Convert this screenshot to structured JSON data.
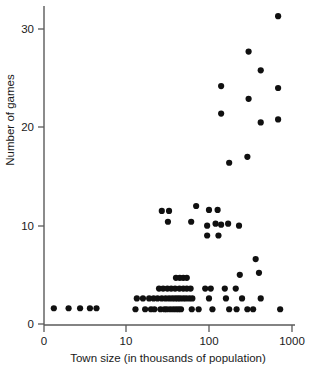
{
  "chart_data": {
    "type": "scatter",
    "title": "",
    "xlabel": "Town size  (in thousands of population)",
    "ylabel": "Number of games",
    "x_scale": "log",
    "y_scale": "linear",
    "xtick_labels": [
      "0",
      "10",
      "100",
      "1000"
    ],
    "xtick_values": [
      0,
      10,
      100,
      1000
    ],
    "ytick_labels": [
      "0",
      "10",
      "20",
      "30"
    ],
    "ytick_values": [
      0,
      10,
      20,
      30
    ],
    "ylim": [
      0,
      32.5
    ],
    "grid": false,
    "legend": null,
    "marker": "filled-circle",
    "marker_color": "#101010",
    "marker_size_px": 6.2,
    "n_points": 92,
    "points": [
      {
        "x": 1.2,
        "y": 1.6
      },
      {
        "x": 3.0,
        "y": 1.6
      },
      {
        "x": 4.4,
        "y": 1.6
      },
      {
        "x": 5.6,
        "y": 1.6
      },
      {
        "x": 6.4,
        "y": 1.6
      },
      {
        "x": 13.0,
        "y": 1.5
      },
      {
        "x": 17.0,
        "y": 1.5
      },
      {
        "x": 20.0,
        "y": 1.5
      },
      {
        "x": 22.0,
        "y": 1.5
      },
      {
        "x": 26.0,
        "y": 1.5
      },
      {
        "x": 29.0,
        "y": 1.5
      },
      {
        "x": 31.0,
        "y": 1.5
      },
      {
        "x": 34.0,
        "y": 1.5
      },
      {
        "x": 37.0,
        "y": 1.5
      },
      {
        "x": 40.0,
        "y": 1.5
      },
      {
        "x": 43.0,
        "y": 1.5
      },
      {
        "x": 46.0,
        "y": 1.5
      },
      {
        "x": 62.0,
        "y": 1.5
      },
      {
        "x": 75.0,
        "y": 1.5
      },
      {
        "x": 110.0,
        "y": 1.5
      },
      {
        "x": 175.0,
        "y": 1.5
      },
      {
        "x": 215.0,
        "y": 1.5
      },
      {
        "x": 290.0,
        "y": 1.5
      },
      {
        "x": 340.0,
        "y": 1.5
      },
      {
        "x": 720.0,
        "y": 1.5
      },
      {
        "x": 13.5,
        "y": 2.6
      },
      {
        "x": 16.0,
        "y": 2.6
      },
      {
        "x": 19.0,
        "y": 2.6
      },
      {
        "x": 21.5,
        "y": 2.6
      },
      {
        "x": 24.0,
        "y": 2.6
      },
      {
        "x": 27.0,
        "y": 2.6
      },
      {
        "x": 30.0,
        "y": 2.6
      },
      {
        "x": 33.0,
        "y": 2.6
      },
      {
        "x": 36.0,
        "y": 2.6
      },
      {
        "x": 39.0,
        "y": 2.6
      },
      {
        "x": 42.0,
        "y": 2.6
      },
      {
        "x": 45.0,
        "y": 2.6
      },
      {
        "x": 49.0,
        "y": 2.6
      },
      {
        "x": 53.0,
        "y": 2.6
      },
      {
        "x": 58.0,
        "y": 2.6
      },
      {
        "x": 63.0,
        "y": 2.6
      },
      {
        "x": 100.0,
        "y": 2.6
      },
      {
        "x": 160.0,
        "y": 2.6
      },
      {
        "x": 250.0,
        "y": 2.6
      },
      {
        "x": 420.0,
        "y": 2.6
      },
      {
        "x": 25.0,
        "y": 3.6
      },
      {
        "x": 28.0,
        "y": 3.6
      },
      {
        "x": 31.5,
        "y": 3.6
      },
      {
        "x": 35.0,
        "y": 3.6
      },
      {
        "x": 39.0,
        "y": 3.6
      },
      {
        "x": 44.0,
        "y": 3.6
      },
      {
        "x": 49.0,
        "y": 3.6
      },
      {
        "x": 54.0,
        "y": 3.6
      },
      {
        "x": 60.0,
        "y": 3.6
      },
      {
        "x": 90.0,
        "y": 3.6
      },
      {
        "x": 105.0,
        "y": 3.6
      },
      {
        "x": 155.0,
        "y": 3.6
      },
      {
        "x": 210.0,
        "y": 3.6
      },
      {
        "x": 40.0,
        "y": 4.7
      },
      {
        "x": 44.5,
        "y": 4.7
      },
      {
        "x": 49.0,
        "y": 4.7
      },
      {
        "x": 54.0,
        "y": 4.7
      },
      {
        "x": 235.0,
        "y": 5.0
      },
      {
        "x": 400.0,
        "y": 5.2
      },
      {
        "x": 365.0,
        "y": 6.6
      },
      {
        "x": 95.0,
        "y": 9.0
      },
      {
        "x": 130.0,
        "y": 9.0
      },
      {
        "x": 95.0,
        "y": 10.0
      },
      {
        "x": 120.0,
        "y": 10.2
      },
      {
        "x": 140.0,
        "y": 10.1
      },
      {
        "x": 170.0,
        "y": 10.2
      },
      {
        "x": 61.0,
        "y": 10.4
      },
      {
        "x": 230.0,
        "y": 10.0
      },
      {
        "x": 27.0,
        "y": 11.5
      },
      {
        "x": 33.0,
        "y": 11.5
      },
      {
        "x": 32.0,
        "y": 10.4
      },
      {
        "x": 100.0,
        "y": 11.6
      },
      {
        "x": 127.0,
        "y": 11.6
      },
      {
        "x": 70.0,
        "y": 12.0
      },
      {
        "x": 175.0,
        "y": 16.4
      },
      {
        "x": 290.0,
        "y": 17.0
      },
      {
        "x": 420.0,
        "y": 20.5
      },
      {
        "x": 680.0,
        "y": 20.8
      },
      {
        "x": 140.0,
        "y": 21.4
      },
      {
        "x": 300.0,
        "y": 22.9
      },
      {
        "x": 680.0,
        "y": 24.0
      },
      {
        "x": 140.0,
        "y": 24.2
      },
      {
        "x": 420.0,
        "y": 25.8
      },
      {
        "x": 300.0,
        "y": 27.7
      },
      {
        "x": 680.0,
        "y": 31.3
      }
    ]
  },
  "axes": {
    "x_axis_label": "Town size  (in thousands of population)",
    "y_axis_label": "Number of games"
  }
}
